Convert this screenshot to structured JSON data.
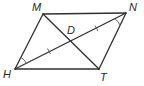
{
  "figure": {
    "type": "parallelogram",
    "stroke_color": "#2f2f2f",
    "vertices": {
      "M": {
        "label": "M",
        "x": 43,
        "y": 14
      },
      "N": {
        "label": "N",
        "x": 126,
        "y": 13
      },
      "T": {
        "label": "T",
        "x": 99,
        "y": 69
      },
      "H": {
        "label": "H",
        "x": 15,
        "y": 69
      }
    },
    "intersection": {
      "label": "D",
      "x": 71,
      "y": 41
    },
    "diagonals": [
      "MT",
      "HN"
    ],
    "congruent_segments": [
      "HD",
      "DN"
    ],
    "congruent_angles": [
      "angle at H (MHN)",
      "angle at N (HNT)"
    ]
  }
}
